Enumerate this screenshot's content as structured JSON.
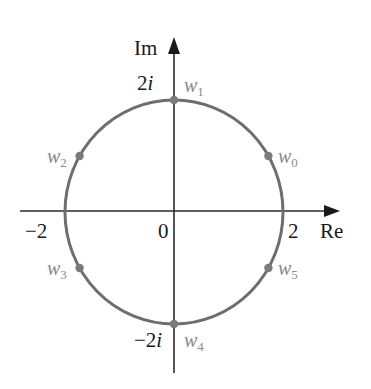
{
  "figure": {
    "axes": {
      "x_label": "Re",
      "y_label": "Im"
    },
    "ticks": {
      "origin": "0",
      "x_pos": "2",
      "x_neg": "−2",
      "y_pos_num": "2",
      "y_pos_unit": "i",
      "y_neg_num": "−2",
      "y_neg_unit": "i"
    },
    "circle": {
      "radius": 2,
      "center": [
        0,
        0
      ],
      "color": "#6e6e6e"
    },
    "points": [
      {
        "name": "w",
        "index": "0",
        "angle_deg": 30
      },
      {
        "name": "w",
        "index": "1",
        "angle_deg": 90
      },
      {
        "name": "w",
        "index": "2",
        "angle_deg": 150
      },
      {
        "name": "w",
        "index": "3",
        "angle_deg": 210
      },
      {
        "name": "w",
        "index": "4",
        "angle_deg": 270
      },
      {
        "name": "w",
        "index": "5",
        "angle_deg": 330
      }
    ],
    "colors": {
      "axis": "#2b2b2b",
      "circle": "#6e6e6e",
      "point": "#7a7a7a",
      "point_label": "#8a8a8a",
      "text": "#1a1a1a"
    }
  }
}
